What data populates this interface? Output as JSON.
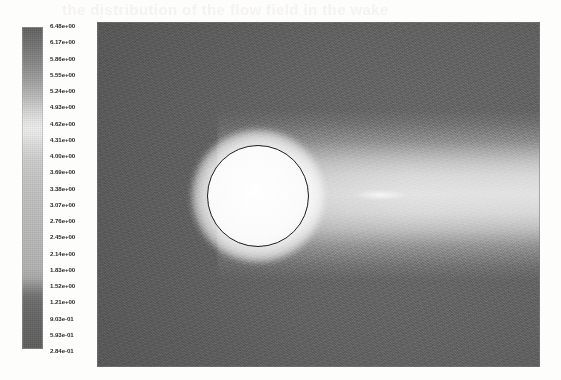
{
  "figure": {
    "kind": "cfd-contour-plot",
    "ghost_text": "the distribution of the flow field in the wake"
  },
  "colorbar": {
    "name": "contour-colorbar",
    "orientation": "vertical",
    "position": "left",
    "scale": "linear",
    "notation": "scientific",
    "min_label": "2.84e-01",
    "max_label": "6.48e+00",
    "step": 0.31,
    "labels": [
      "6.48e+00",
      "6.17e+00",
      "5.86e+00",
      "5.55e+00",
      "5.24e+00",
      "4.93e+00",
      "4.62e+00",
      "4.31e+00",
      "4.00e+00",
      "3.69e+00",
      "3.38e+00",
      "3.07e+00",
      "2.76e+00",
      "2.45e+00",
      "2.14e+00",
      "1.83e+00",
      "1.52e+00",
      "1.21e+00",
      "9.03e-01",
      "5.93e-01",
      "2.84e-01"
    ]
  },
  "chart_data": {
    "type": "heatmap",
    "title": "",
    "xlabel": "",
    "ylabel": "",
    "legend_position": "left",
    "grid": false,
    "colormap": "grayscale",
    "colorbar_ticks": [
      6.48,
      6.17,
      5.86,
      5.55,
      5.24,
      4.93,
      4.62,
      4.31,
      4.0,
      3.69,
      3.38,
      3.07,
      2.76,
      2.45,
      2.14,
      1.83,
      1.52,
      1.21,
      0.903,
      0.593,
      0.284
    ],
    "colorbar_tick_labels": [
      "6.48e+00",
      "6.17e+00",
      "5.86e+00",
      "5.55e+00",
      "5.24e+00",
      "4.93e+00",
      "4.62e+00",
      "4.31e+00",
      "4.00e+00",
      "3.69e+00",
      "3.38e+00",
      "3.07e+00",
      "2.76e+00",
      "2.45e+00",
      "2.14e+00",
      "1.83e+00",
      "1.52e+00",
      "1.21e+00",
      "9.03e-01",
      "5.93e-01",
      "2.84e-01"
    ],
    "clim": [
      0.284,
      6.48
    ],
    "features": [
      {
        "name": "freestream",
        "value": 2.45,
        "region": "far-field background"
      },
      {
        "name": "cylinder-surface",
        "value": 6.48,
        "region": "circular obstacle centre-left"
      },
      {
        "name": "cylinder-halo",
        "value": 5.55,
        "region": "annulus around cylinder"
      },
      {
        "name": "wake-core",
        "value": 4.31,
        "region": "horizontal band downstream"
      },
      {
        "name": "recirculation-lobes",
        "value": 1.21,
        "region": "paired dark lobes behind cylinder"
      },
      {
        "name": "shear-spike",
        "value": 5.24,
        "region": "bright centreline filament behind cylinder"
      },
      {
        "name": "upper-lower-far-field",
        "value": 0.903,
        "region": "top and bottom dark bands"
      }
    ]
  },
  "plot": {
    "name": "contour-plot-canvas",
    "cylinder_label": "circular cylinder",
    "wake_label": "downstream wake"
  }
}
